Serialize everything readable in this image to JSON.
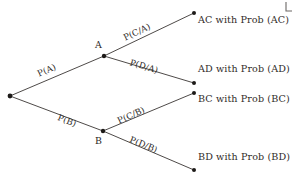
{
  "diagram": {
    "type": "probability-tree",
    "background_color": "#ffffff",
    "line_color": "#3a3633",
    "text_color": "#2b2724"
  },
  "nodes": {
    "root": {
      "label": "",
      "x": 10,
      "y": 96
    },
    "a": {
      "label": "A",
      "x": 104,
      "y": 56,
      "label_x": 95,
      "label_y": 40
    },
    "b": {
      "label": "B",
      "x": 103,
      "y": 131,
      "label_x": 95,
      "label_y": 136
    },
    "ac": {
      "label": "",
      "x": 194,
      "y": 13
    },
    "ad": {
      "label": "",
      "x": 194,
      "y": 83
    },
    "bc": {
      "label": "",
      "x": 194,
      "y": 93
    },
    "bd": {
      "label": "",
      "x": 194,
      "y": 170
    }
  },
  "branches": [
    {
      "id": "root-a",
      "label": "P(A)",
      "from": "root",
      "to": "a",
      "label_x": 38,
      "label_y": 70,
      "angle": -24
    },
    {
      "id": "root-b",
      "label": "P(B)",
      "from": "root",
      "to": "b",
      "label_x": 58,
      "label_y": 113,
      "angle": 21
    },
    {
      "id": "a-ac",
      "label": "P(C/A)",
      "from": "a",
      "to": "ac",
      "label_x": 124,
      "label_y": 34,
      "angle": -25
    },
    {
      "id": "a-ad",
      "label": "P(D/A)",
      "from": "a",
      "to": "ad",
      "label_x": 130,
      "label_y": 58,
      "angle": 17
    },
    {
      "id": "b-bc",
      "label": "P(C/B)",
      "from": "b",
      "to": "bc",
      "label_x": 118,
      "label_y": 117,
      "angle": -24
    },
    {
      "id": "b-bd",
      "label": "P(D/B)",
      "from": "b",
      "to": "bd",
      "label_x": 130,
      "label_y": 135,
      "angle": 22
    }
  ],
  "outcomes": [
    {
      "id": "ac",
      "text": "AC with Prob (AC)",
      "x": 198,
      "y": 15
    },
    {
      "id": "ad",
      "text": "AD with Prob (AD)",
      "x": 198,
      "y": 64
    },
    {
      "id": "bc",
      "text": "BC with Prob (BC)",
      "x": 198,
      "y": 94
    },
    {
      "id": "bd",
      "text": "BD with Prob (BD)",
      "x": 198,
      "y": 152
    }
  ],
  "artifacts": {
    "corner_scan_mark": "L"
  }
}
